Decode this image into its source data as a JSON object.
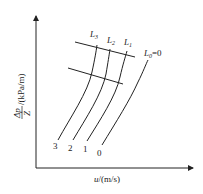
{
  "figure": {
    "type": "diagram",
    "y_axis": {
      "label_numerator": "Δp",
      "label_denominator": "Z",
      "label_unit": "/(kPa/m)"
    },
    "x_axis": {
      "label_var": "u",
      "label_unit": "/(m/s)"
    },
    "curves": [
      {
        "id": "3",
        "bottom_label": "3",
        "top_label_main": "L",
        "top_label_sub": "3"
      },
      {
        "id": "2",
        "bottom_label": "2",
        "top_label_main": "L",
        "top_label_sub": "2"
      },
      {
        "id": "1",
        "bottom_label": "1",
        "top_label_main": "L",
        "top_label_sub": "1"
      },
      {
        "id": "0",
        "bottom_label": "0",
        "top_label_main": "L",
        "top_label_sub": "0",
        "top_label_suffix": "=0"
      }
    ],
    "reference_lines": [
      {
        "name": "flooding-line"
      },
      {
        "name": "loading-line"
      }
    ],
    "colors": {
      "line": "#222222",
      "background": "#ffffff"
    }
  }
}
